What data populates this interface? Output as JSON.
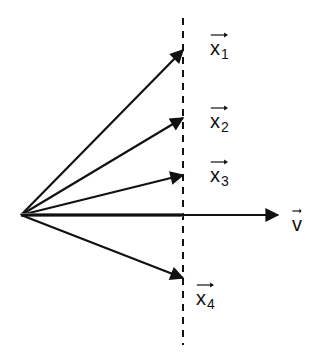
{
  "diagram": {
    "title": "",
    "colors": {
      "line": "#111111",
      "v_shaft_overlap": "#6a6a6a",
      "background": "#ffffff"
    },
    "origin": {
      "x": 21,
      "y": 215
    },
    "dashed_line": {
      "x": 183,
      "y1": 18,
      "y2": 345
    },
    "vectors": [
      {
        "id": "x1",
        "base": "x",
        "subscript": "1",
        "tip": {
          "x": 183,
          "y": 50
        },
        "label_pos": {
          "x": 210,
          "y": 30
        }
      },
      {
        "id": "x2",
        "base": "x",
        "subscript": "2",
        "tip": {
          "x": 183,
          "y": 118
        },
        "label_pos": {
          "x": 210,
          "y": 103
        }
      },
      {
        "id": "x3",
        "base": "x",
        "subscript": "3",
        "tip": {
          "x": 183,
          "y": 175
        },
        "label_pos": {
          "x": 210,
          "y": 157
        }
      },
      {
        "id": "v",
        "base": "v",
        "subscript": "",
        "tip": {
          "x": 278,
          "y": 215
        },
        "label_pos": {
          "x": 292,
          "y": 206
        }
      },
      {
        "id": "x4",
        "base": "x",
        "subscript": "4",
        "tip": {
          "x": 183,
          "y": 278
        },
        "label_pos": {
          "x": 196,
          "y": 280
        }
      }
    ]
  }
}
